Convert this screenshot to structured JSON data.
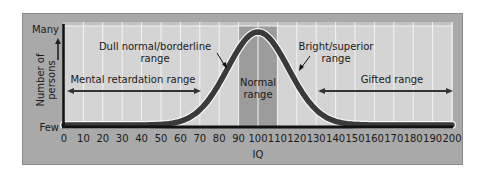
{
  "chart_data": {
    "type": "area",
    "title": "",
    "xlabel": "IQ",
    "ylabel": "Number of persons",
    "y_ticks": [
      "Few",
      "Many"
    ],
    "x_ticks": [
      0,
      10,
      20,
      30,
      40,
      50,
      60,
      70,
      80,
      90,
      100,
      110,
      120,
      130,
      140,
      150,
      160,
      170,
      180,
      190,
      200
    ],
    "xlim": [
      0,
      200
    ],
    "ylim": [
      "Few",
      "Many"
    ],
    "grid": true,
    "legend": null,
    "distribution": {
      "shape": "normal",
      "mean": 100,
      "sd": 15
    },
    "series": [
      {
        "name": "IQ distribution",
        "x": [
          0,
          10,
          20,
          30,
          40,
          50,
          60,
          70,
          80,
          85,
          90,
          95,
          100,
          105,
          110,
          115,
          120,
          130,
          140,
          150,
          160,
          170,
          180,
          190,
          200
        ],
        "values": [
          0,
          0,
          0,
          0,
          0.0003,
          0.004,
          0.028,
          0.135,
          0.411,
          0.607,
          0.801,
          0.946,
          1.0,
          0.946,
          0.801,
          0.607,
          0.411,
          0.135,
          0.028,
          0.004,
          0.0003,
          0,
          0,
          0,
          0
        ]
      }
    ],
    "highlight": {
      "label": "Normal range",
      "x_range": [
        90,
        110
      ]
    },
    "annotations": [
      {
        "text": "Dull normal/borderline range",
        "points_to_iq": 80
      },
      {
        "text": "Bright/superior range",
        "points_to_iq": 120
      },
      {
        "text": "Mental retardation range",
        "x_range": [
          0,
          70
        ],
        "arrow": "double"
      },
      {
        "text": "Normal range",
        "x_range": [
          90,
          110
        ]
      },
      {
        "text": "Gifted range",
        "x_range": [
          130,
          200
        ],
        "arrow": "double"
      }
    ]
  },
  "labels": {
    "y_many": "Many",
    "y_few": "Few",
    "y_axis_line1": "Number of",
    "y_axis_line2": "persons",
    "x_axis": "IQ",
    "dull_1": "Dull normal/borderline",
    "dull_2": "range",
    "bright_1": "Bright/superior",
    "bright_2": "range",
    "mental": "Mental retardation range",
    "normal_1": "Normal",
    "normal_2": "range",
    "gifted": "Gifted range"
  },
  "colors": {
    "frame": "#a9a9a9",
    "plot_bg": "#d4d4d4",
    "normal_band": "#9c9c9c",
    "curve": "#3a3a3a",
    "gridline": "#f2f2f2",
    "axis": "#111111"
  }
}
